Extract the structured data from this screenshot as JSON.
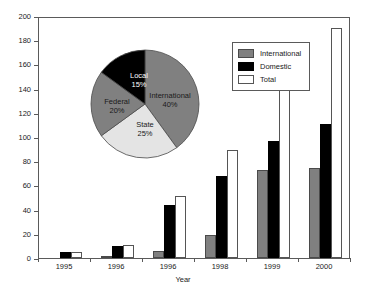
{
  "chart_data": [
    {
      "type": "bar",
      "title": "",
      "xlabel": "Year",
      "ylabel": "",
      "categories": [
        "1995",
        "1996",
        "1996",
        "1998",
        "1999",
        "2000"
      ],
      "series": [
        {
          "name": "International",
          "color": "#808080",
          "values": [
            0,
            2,
            6,
            19,
            73,
            74
          ]
        },
        {
          "name": "Domestic",
          "color": "#000000",
          "values": [
            5,
            10,
            44,
            68,
            97,
            111
          ]
        },
        {
          "name": "Total",
          "color": "#ffffff",
          "values": [
            5,
            11,
            51,
            89,
            175,
            190
          ]
        }
      ],
      "ylim": [
        0,
        200
      ],
      "yticks": [
        0,
        20,
        40,
        60,
        80,
        100,
        120,
        140,
        160,
        180,
        200
      ],
      "grid": false,
      "legend_position": "top-right"
    },
    {
      "type": "pie",
      "title": "",
      "labels": [
        "International",
        "State",
        "Federal",
        "Local"
      ],
      "values": [
        40,
        25,
        20,
        15
      ],
      "value_labels": [
        "40%",
        "25%",
        "20%",
        "15%"
      ],
      "colors": [
        "#808080",
        "#e4e4e4",
        "#808080",
        "#000000"
      ],
      "legend_position": "none"
    }
  ],
  "legend": {
    "items": [
      {
        "label": "International",
        "swatch": "international"
      },
      {
        "label": "Domestic",
        "swatch": "domestic"
      },
      {
        "label": "Total",
        "swatch": "total"
      }
    ]
  }
}
